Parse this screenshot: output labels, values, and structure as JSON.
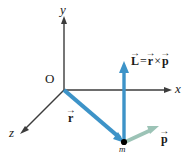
{
  "figure": {
    "background": "#ffffff",
    "width": 193,
    "height": 158
  },
  "colors": {
    "axis": "#3c3c3c",
    "text": "#1a1a1a",
    "vector_blue": "#3d93c8",
    "vector_blue_dark": "#2f86bd",
    "vector_green": "#9cc3b6",
    "point_black": "#000000"
  },
  "axes": [
    {
      "name": "y-axis",
      "label": "y",
      "label_x": 61,
      "label_y": 4,
      "x1": 64,
      "y1": 18,
      "x2": 64,
      "y2": 90
    },
    {
      "name": "x-axis",
      "label": "x",
      "label_x": 174,
      "label_y": 82,
      "x1": 64,
      "y1": 90,
      "x2": 171,
      "y2": 90
    },
    {
      "name": "z-axis",
      "label": "z",
      "label_x": 10,
      "label_y": 126,
      "x1": 64,
      "y1": 90,
      "x2": 21,
      "y2": 133
    }
  ],
  "origin": {
    "label": "O",
    "label_x": 46,
    "label_y": 73,
    "x": 64,
    "y": 90
  },
  "vectors": [
    {
      "name": "r-vector",
      "label_plain": "r",
      "label_arrow": "→",
      "x1": 64,
      "y1": 90,
      "x2": 124,
      "y2": 142,
      "color": "#3d93c8",
      "label_x": 68,
      "label_y": 113
    },
    {
      "name": "L-vector",
      "label_plain": "L",
      "label_arrow": "→",
      "x1": 124,
      "y1": 142,
      "x2": 124,
      "y2": 63,
      "color": "#3d93c8",
      "label_x": 131,
      "label_y": 57
    },
    {
      "name": "p-vector",
      "label_plain": "p",
      "label_arrow": "→",
      "x1": 124,
      "y1": 142,
      "x2": 158,
      "y2": 127,
      "color": "#9cc3b6",
      "label_x": 161,
      "label_y": 133
    }
  ],
  "equation": {
    "name": "angular-momentum-equation",
    "full_text": "L = r × p",
    "lhs": "L",
    "operator_equals": "=",
    "rhs_first": "r",
    "operator_cross": "×",
    "rhs_second": "p",
    "arrow": "→",
    "x": 131,
    "y": 56
  },
  "mass_point": {
    "name": "mass-point",
    "label": "m",
    "label_x": 119,
    "label_y": 144,
    "x": 124,
    "y": 142,
    "radius": 3
  }
}
